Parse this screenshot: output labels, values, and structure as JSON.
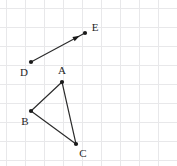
{
  "figure": {
    "canvas": {
      "width": 177,
      "height": 166
    },
    "background_color": "#ffffff",
    "grid": {
      "visible": true,
      "color": "#e8e8ea",
      "spacing": 19,
      "origin_x": 6,
      "origin_y": 8
    },
    "stroke_color": "#2b2b2b",
    "point_color": "#1a1a1a",
    "label_color": "#1f1f1f",
    "points": [
      {
        "id": "A",
        "label": "A",
        "x": 62,
        "y": 82,
        "label_x": 62,
        "label_y": 71,
        "label_anchor": "middle"
      },
      {
        "id": "B",
        "label": "B",
        "x": 31,
        "y": 111,
        "label_x": 25,
        "label_y": 122,
        "label_anchor": "middle"
      },
      {
        "id": "C",
        "label": "C",
        "x": 76,
        "y": 144,
        "label_x": 83,
        "label_y": 154,
        "label_anchor": "middle"
      },
      {
        "id": "D",
        "label": "D",
        "x": 31,
        "y": 62,
        "label_x": 24,
        "label_y": 73,
        "label_anchor": "middle"
      },
      {
        "id": "E",
        "label": "E",
        "x": 85,
        "y": 33,
        "label_x": 95,
        "label_y": 28,
        "label_anchor": "middle"
      }
    ],
    "segments": [
      {
        "id": "AB",
        "from": "A",
        "to": "B"
      },
      {
        "id": "BC",
        "from": "B",
        "to": "C"
      },
      {
        "id": "CA",
        "from": "C",
        "to": "A"
      }
    ],
    "vectors": [
      {
        "id": "DE",
        "from": "D",
        "to": "E",
        "arrowhead": true,
        "arrowhead_at": "end"
      }
    ]
  }
}
